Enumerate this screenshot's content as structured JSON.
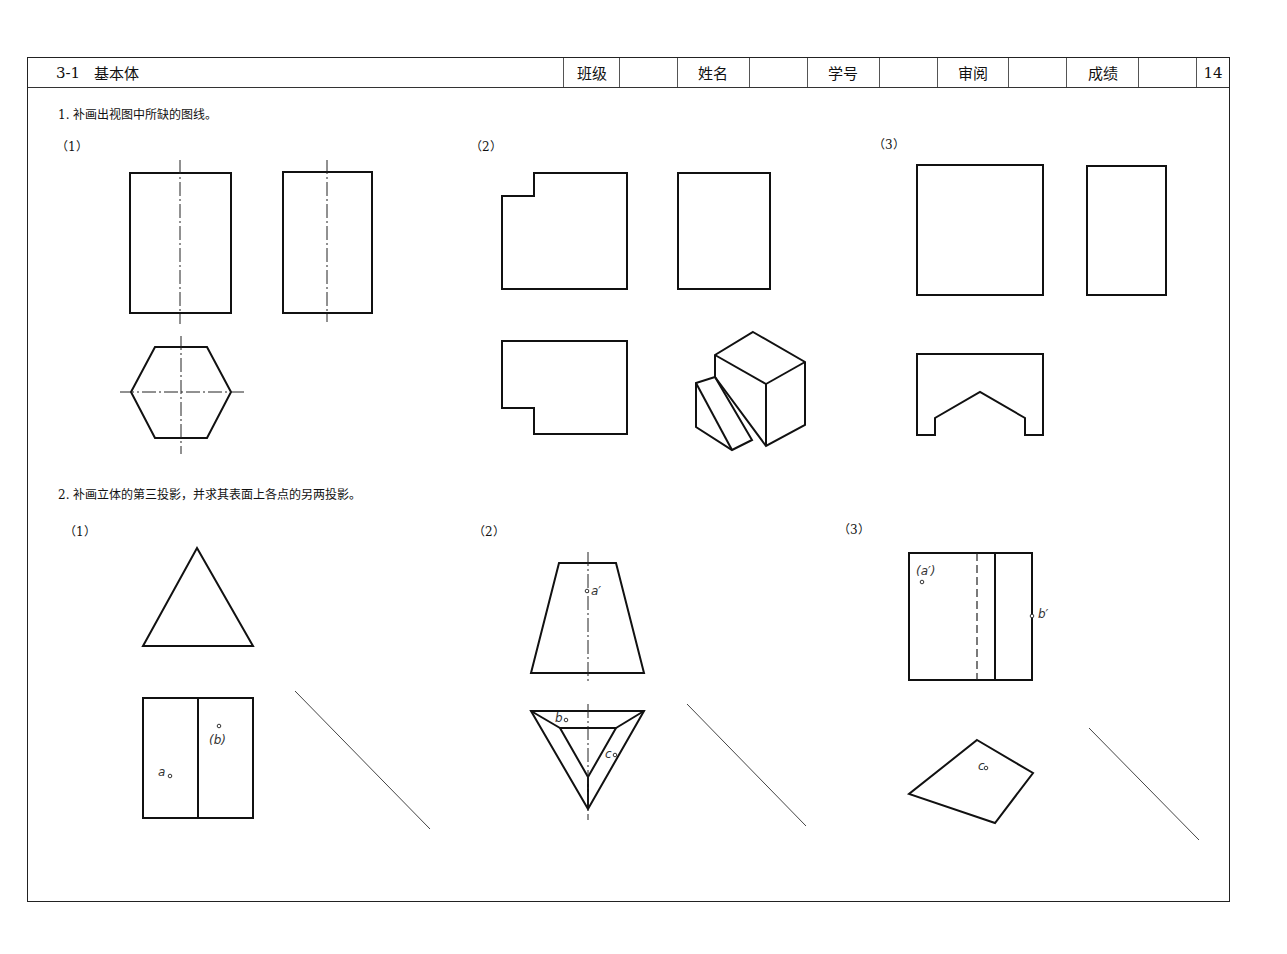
{
  "header": {
    "number": "3-1",
    "title": "基本体",
    "fields": [
      {
        "label": "班级",
        "value": ""
      },
      {
        "label": "姓名",
        "value": ""
      },
      {
        "label": "学号",
        "value": ""
      },
      {
        "label": "审阅",
        "value": ""
      },
      {
        "label": "成绩",
        "value": ""
      }
    ],
    "page": "14"
  },
  "section1": {
    "instruction": "1. 补画出视图中所缺的图线。",
    "subs": [
      "（1）",
      "（2）",
      "（3）"
    ]
  },
  "section2": {
    "instruction": "2. 补画立体的第三投影，并求其表面上各点的另两投影。",
    "subs": [
      "（1）",
      "（2）",
      "（3）"
    ],
    "labels": {
      "p1_a": "a",
      "p1_b": "(b)",
      "p2_a": "a′",
      "p2_b": "b",
      "p2_c": "c",
      "p3_a": "(a′)",
      "p3_b": "b′",
      "p3_c": "c"
    }
  }
}
